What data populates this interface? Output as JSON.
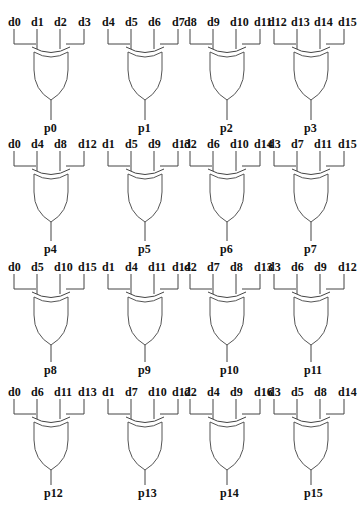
{
  "diagram": {
    "type": "xor-gate-grid",
    "gates": [
      {
        "output": "p0",
        "inputs": [
          "d0",
          "d1",
          "d2",
          "d3"
        ]
      },
      {
        "output": "p1",
        "inputs": [
          "d4",
          "d5",
          "d6",
          "d7"
        ]
      },
      {
        "output": "p2",
        "inputs": [
          "d8",
          "d9",
          "d10",
          "d11"
        ]
      },
      {
        "output": "p3",
        "inputs": [
          "d12",
          "d13",
          "d14",
          "d15"
        ]
      },
      {
        "output": "p4",
        "inputs": [
          "d0",
          "d4",
          "d8",
          "d12"
        ]
      },
      {
        "output": "p5",
        "inputs": [
          "d1",
          "d5",
          "d9",
          "d13"
        ]
      },
      {
        "output": "p6",
        "inputs": [
          "d2",
          "d6",
          "d10",
          "d14"
        ]
      },
      {
        "output": "p7",
        "inputs": [
          "d3",
          "d7",
          "d11",
          "d15"
        ]
      },
      {
        "output": "p8",
        "inputs": [
          "d0",
          "d5",
          "d10",
          "d15"
        ]
      },
      {
        "output": "p9",
        "inputs": [
          "d1",
          "d4",
          "d11",
          "d14"
        ]
      },
      {
        "output": "p10",
        "inputs": [
          "d2",
          "d7",
          "d8",
          "d13"
        ]
      },
      {
        "output": "p11",
        "inputs": [
          "d3",
          "d6",
          "d9",
          "d12"
        ]
      },
      {
        "output": "p12",
        "inputs": [
          "d0",
          "d6",
          "d11",
          "d13"
        ]
      },
      {
        "output": "p13",
        "inputs": [
          "d1",
          "d7",
          "d10",
          "d12"
        ]
      },
      {
        "output": "p14",
        "inputs": [
          "d2",
          "d4",
          "d9",
          "d16"
        ]
      },
      {
        "output": "p15",
        "inputs": [
          "d3",
          "d5",
          "d8",
          "d14"
        ]
      }
    ]
  }
}
